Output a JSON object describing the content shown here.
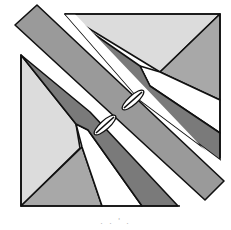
{
  "figure": {
    "type": "quilt-block-diagram",
    "caption": ". . ' .",
    "colors": {
      "outline": "#111111",
      "light_gray": "#dcdcdc",
      "medium_gray": "#a8a8a8",
      "band_gray": "#9a9a9a",
      "dark_gray": "#7a7a7a",
      "white": "#ffffff"
    },
    "markers": [
      {
        "name": "seam-mark-upper",
        "x": 133,
        "y": 100
      },
      {
        "name": "seam-mark-lower",
        "x": 105,
        "y": 124
      }
    ]
  }
}
